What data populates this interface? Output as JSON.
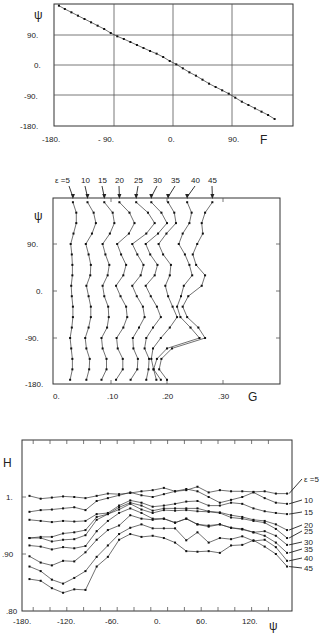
{
  "chart_data": [
    {
      "type": "line",
      "title": "",
      "xlabel": "F",
      "ylabel": "ψ",
      "xlim": [
        -180,
        120
      ],
      "ylim": [
        -180,
        140
      ],
      "xticks": [
        "-180.",
        "- 90.",
        "0.",
        "90."
      ],
      "yticks": [
        "90.",
        "0.",
        "-90.",
        "-180."
      ],
      "grid": true,
      "series": [
        {
          "name": "ψ vs F",
          "x": [
            -174,
            -165,
            -155,
            -145,
            -135,
            -125,
            -115,
            -105,
            -95,
            -85,
            -75,
            -65,
            -55,
            -45,
            -35,
            -25,
            -15,
            -5,
            5,
            15,
            25,
            35,
            45,
            55,
            65,
            75,
            85,
            95,
            105,
            115,
            125,
            135,
            145,
            155
          ],
          "y": [
            178,
            168,
            158,
            148,
            138,
            128,
            118,
            108,
            96,
            86,
            78,
            69,
            60,
            51,
            42,
            34,
            24,
            12,
            2,
            -10,
            -22,
            -32,
            -44,
            -56,
            -66,
            -76,
            -86,
            -98,
            -110,
            -120,
            -130,
            -140,
            -150,
            -162
          ]
        }
      ]
    },
    {
      "type": "line",
      "title": "",
      "xlabel": "G",
      "ylabel": "ψ",
      "xlim": [
        0,
        0.38
      ],
      "ylim": [
        -180,
        180
      ],
      "xticks": [
        "0.",
        ".10",
        ".20",
        ".30"
      ],
      "yticks": [
        "90.",
        "0.",
        "-90.",
        "-180."
      ],
      "grid": false,
      "annotation": "ε = 5  10  15  20  25  30  35  40  45",
      "psi": [
        170,
        150,
        130,
        110,
        90,
        70,
        50,
        30,
        10,
        -10,
        -30,
        -50,
        -70,
        -90,
        -110,
        -130,
        -150,
        -170
      ],
      "series": [
        {
          "name": "ε=5",
          "values": [
            0.032,
            0.038,
            0.038,
            0.033,
            0.028,
            0.03,
            0.031,
            0.031,
            0.029,
            0.03,
            0.032,
            0.032,
            0.03,
            0.027,
            0.029,
            0.031,
            0.031,
            0.027
          ]
        },
        {
          "name": "ε=10",
          "values": [
            0.058,
            0.069,
            0.073,
            0.066,
            0.055,
            0.06,
            0.064,
            0.063,
            0.056,
            0.06,
            0.064,
            0.064,
            0.06,
            0.054,
            0.056,
            0.062,
            0.061,
            0.056
          ]
        },
        {
          "name": "ε=15",
          "values": [
            0.088,
            0.103,
            0.106,
            0.098,
            0.085,
            0.09,
            0.097,
            0.094,
            0.085,
            0.088,
            0.095,
            0.096,
            0.093,
            0.083,
            0.085,
            0.092,
            0.092,
            0.083
          ]
        },
        {
          "name": "ε=20",
          "values": [
            0.115,
            0.133,
            0.142,
            0.132,
            0.111,
            0.118,
            0.127,
            0.122,
            0.109,
            0.117,
            0.127,
            0.129,
            0.122,
            0.11,
            0.112,
            0.121,
            0.121,
            0.109
          ]
        },
        {
          "name": "ε=25",
          "values": [
            0.145,
            0.166,
            0.178,
            0.163,
            0.138,
            0.147,
            0.158,
            0.153,
            0.138,
            0.146,
            0.157,
            0.16,
            0.15,
            0.139,
            0.14,
            0.148,
            0.147,
            0.135
          ]
        },
        {
          "name": "ε=30",
          "values": [
            0.172,
            0.19,
            0.2,
            0.184,
            0.162,
            0.17,
            0.183,
            0.178,
            0.162,
            0.171,
            0.182,
            0.189,
            0.175,
            0.163,
            0.16,
            0.168,
            0.167,
            0.163
          ]
        },
        {
          "name": "ε=35",
          "values": [
            0.202,
            0.213,
            0.216,
            0.199,
            0.185,
            0.193,
            0.207,
            0.205,
            0.197,
            0.202,
            0.21,
            0.218,
            0.205,
            0.189,
            0.175,
            0.172,
            0.176,
            0.181
          ]
        },
        {
          "name": "ε=40",
          "values": [
            0.236,
            0.244,
            0.24,
            0.228,
            0.221,
            0.232,
            0.24,
            0.245,
            0.23,
            0.225,
            0.218,
            0.224,
            0.242,
            0.258,
            0.2,
            0.182,
            0.176,
            0.189
          ]
        },
        {
          "name": "ε=45",
          "values": [
            0.281,
            0.268,
            0.262,
            0.264,
            0.254,
            0.246,
            0.252,
            0.268,
            0.262,
            0.238,
            0.228,
            0.236,
            0.256,
            0.268,
            0.209,
            0.19,
            0.186,
            0.2
          ]
        }
      ]
    },
    {
      "type": "line",
      "title": "",
      "xlabel": "ψ",
      "ylabel": "H",
      "xlim": [
        -180,
        180
      ],
      "ylim": [
        0.8,
        1.06
      ],
      "xticks": [
        "-180.",
        "-120.",
        "-60.",
        "0.",
        "60.",
        "120."
      ],
      "yticks": [
        "1.",
        ".90",
        ".80"
      ],
      "grid": false,
      "x": [
        -170,
        -155,
        -140,
        -125,
        -110,
        -95,
        -80,
        -65,
        -50,
        -35,
        -20,
        -5,
        10,
        25,
        40,
        55,
        70,
        85,
        100,
        115,
        130,
        145,
        160,
        175
      ],
      "series": [
        {
          "name": "ε=5",
          "values": [
            1.002,
            0.997,
            0.999,
            1.001,
            1.0,
            0.998,
            1.002,
            1.006,
            1.005,
            1.007,
            1.01,
            1.012,
            1.016,
            1.01,
            1.012,
            1.018,
            1.008,
            1.012,
            1.01,
            1.01,
            1.009,
            1.01,
            1.006,
            1.006
          ]
        },
        {
          "name": "ε=10",
          "values": [
            0.974,
            0.977,
            0.978,
            0.98,
            0.982,
            0.977,
            0.993,
            0.998,
            1.003,
            1.008,
            1.003,
            1.0,
            1.005,
            1.01,
            1.014,
            1.01,
            1.0,
            0.99,
            0.995,
            1.0,
            1.008,
            0.998,
            0.99,
            0.988
          ]
        },
        {
          "name": "ε=15",
          "values": [
            0.96,
            0.958,
            0.956,
            0.958,
            0.957,
            0.958,
            0.97,
            0.972,
            0.985,
            0.994,
            0.99,
            0.983,
            0.985,
            0.988,
            0.992,
            0.993,
            0.985,
            0.985,
            0.99,
            0.988,
            0.98,
            0.975,
            0.972,
            0.97
          ]
        },
        {
          "name": "ε=20",
          "values": [
            0.928,
            0.93,
            0.93,
            0.936,
            0.938,
            0.942,
            0.965,
            0.97,
            0.982,
            0.99,
            0.985,
            0.976,
            0.98,
            0.98,
            0.98,
            0.98,
            0.975,
            0.973,
            0.968,
            0.965,
            0.96,
            0.958,
            0.952,
            0.942
          ]
        },
        {
          "name": "ε=25",
          "values": [
            0.928,
            0.928,
            0.922,
            0.925,
            0.926,
            0.933,
            0.96,
            0.97,
            0.978,
            0.988,
            0.978,
            0.972,
            0.977,
            0.976,
            0.977,
            0.975,
            0.974,
            0.972,
            0.964,
            0.962,
            0.958,
            0.955,
            0.944,
            0.928
          ]
        },
        {
          "name": "ε=30",
          "values": [
            0.915,
            0.913,
            0.908,
            0.912,
            0.91,
            0.914,
            0.94,
            0.958,
            0.972,
            0.98,
            0.972,
            0.962,
            0.962,
            0.955,
            0.962,
            0.952,
            0.95,
            0.952,
            0.946,
            0.944,
            0.938,
            0.94,
            0.932,
            0.916
          ]
        },
        {
          "name": "ε=35",
          "values": [
            0.896,
            0.885,
            0.88,
            0.888,
            0.887,
            0.903,
            0.925,
            0.942,
            0.95,
            0.968,
            0.962,
            0.96,
            0.962,
            0.955,
            0.962,
            0.952,
            0.948,
            0.952,
            0.946,
            0.943,
            0.938,
            0.932,
            0.92,
            0.902
          ]
        },
        {
          "name": "ε=40",
          "values": [
            0.878,
            0.87,
            0.855,
            0.848,
            0.858,
            0.87,
            0.895,
            0.915,
            0.935,
            0.946,
            0.952,
            0.945,
            0.945,
            0.945,
            0.924,
            0.938,
            0.92,
            0.928,
            0.926,
            0.931,
            0.923,
            0.925,
            0.912,
            0.888
          ]
        },
        {
          "name": "ε=45",
          "values": [
            0.856,
            0.853,
            0.84,
            0.832,
            0.838,
            0.837,
            0.878,
            0.895,
            0.925,
            0.935,
            0.93,
            0.932,
            0.928,
            0.92,
            0.905,
            0.904,
            0.905,
            0.902,
            0.915,
            0.916,
            0.924,
            0.913,
            0.9,
            0.878
          ]
        }
      ],
      "legend_labels": [
        "ε =5",
        "10",
        "15",
        "20",
        "25",
        "30",
        "35",
        "40",
        "45"
      ]
    }
  ]
}
